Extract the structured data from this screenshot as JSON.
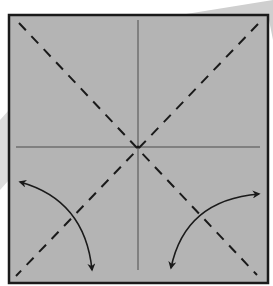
{
  "diagram": {
    "type": "origami-crease-pattern",
    "paper_color": "#b4b4b4",
    "border_color": "#1a1a1a",
    "line_color": "#1a1a1a",
    "square": {
      "x": 9,
      "y": 15,
      "width": 259,
      "height": 268
    },
    "center": {
      "x": 138,
      "y": 147
    },
    "creases": [
      {
        "name": "vertical-valley-fold",
        "style": "solid-thin"
      },
      {
        "name": "horizontal-valley-fold",
        "style": "solid-thin"
      },
      {
        "name": "diagonal-tl-br",
        "style": "dashed"
      },
      {
        "name": "diagonal-tr-bl",
        "style": "dashed"
      }
    ],
    "arrows": [
      {
        "name": "fold-and-unfold-arrow-left",
        "from": [
          18,
          181
        ],
        "to": [
          93,
          272
        ],
        "double_headed": true
      },
      {
        "name": "fold-and-unfold-arrow-right",
        "from": [
          170,
          270
        ],
        "to": [
          260,
          194
        ],
        "double_headed": true
      }
    ]
  }
}
